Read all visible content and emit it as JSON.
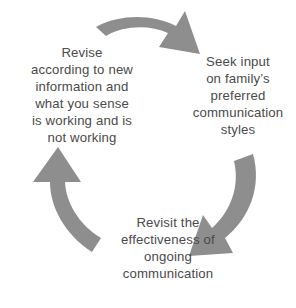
{
  "diagram": {
    "type": "cycle",
    "direction": "clockwise",
    "background_color": "#ffffff",
    "arrow_color": "#8e8e8e",
    "text_color": "#4a4a4a",
    "steps": [
      {
        "id": "seek-input",
        "position": "right",
        "lines": [
          "Seek input",
          "on family’s",
          "preferred",
          "communication",
          "styles"
        ]
      },
      {
        "id": "revisit",
        "position": "bottom",
        "lines": [
          "Revisit the",
          "effectiveness of",
          "ongoing",
          "communication"
        ]
      },
      {
        "id": "revise",
        "position": "left",
        "lines": [
          "Revise",
          "according to new",
          "information and",
          "what you sense",
          "is working and is",
          "not working"
        ]
      }
    ],
    "arrows": [
      {
        "id": "top-arrow",
        "from": "revise",
        "to": "seek-input",
        "direction": "left-to-right-curving-down"
      },
      {
        "id": "right-arrow",
        "from": "seek-input",
        "to": "revisit",
        "direction": "top-to-bottom-curving-left"
      },
      {
        "id": "left-arrow",
        "from": "revisit",
        "to": "revise",
        "direction": "bottom-to-top-curving-up"
      }
    ]
  }
}
